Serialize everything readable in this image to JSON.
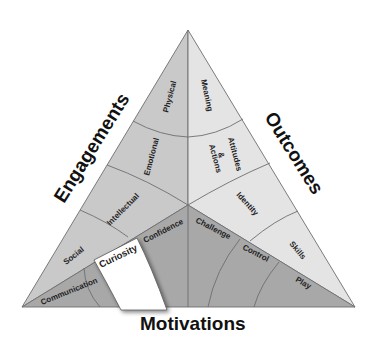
{
  "diagram": {
    "axes": {
      "engagements": "Engagements",
      "outcomes": "Outcomes",
      "motivations": "Motivations"
    },
    "engagements": [
      "Physical",
      "Emotional",
      "Intellectual",
      "Social"
    ],
    "outcomes": [
      "Meaning",
      "Attitudes",
      "&",
      "Actions",
      "Identity",
      "Skills"
    ],
    "motivations": [
      "Communication",
      "Curiosity",
      "Confidence",
      "Challenge",
      "Control",
      "Play"
    ],
    "highlighted": "Curiosity",
    "colors": {
      "engagements_fill": "#c9c9c9",
      "outcomes_fill": "#e6e6e6",
      "motivations_fill": "#a9a9a9",
      "highlight_fill": "#ffffff",
      "line": "#6e6e6e"
    }
  }
}
